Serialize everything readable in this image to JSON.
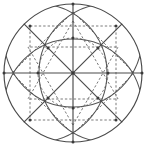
{
  "figure": {
    "background_color": "#ffffff",
    "solid_color": "#4a4a4a",
    "dashed_color": "#7a7a7a",
    "node_color": "#3a3a3a",
    "canvas": {
      "width": 146,
      "height": 147
    },
    "center": {
      "x": 73,
      "y": 73
    },
    "outer_radius": 69,
    "vesica_radius": 69,
    "vesica_offset": 35,
    "inner_radius": 35,
    "labels": {
      "outer_circle": "outer-circle",
      "left_arc": "left-vesica-arc",
      "right_arc": "right-vesica-arc",
      "horizontal_axis": "horizontal-diameter",
      "vertical_axis": "vertical-diameter",
      "diagonal_a": "diagonal-nw-se",
      "diagonal_b": "diagonal-ne-sw",
      "dashed_star": "dashed-star-polygon",
      "inner_dashed_circle": "inner-dashed-circle"
    }
  },
  "chart_data": {
    "type": "diagram",
    "elements": [
      {
        "name": "outer-circle",
        "kind": "circle",
        "cx": 73,
        "cy": 73,
        "r": 69,
        "style": "solid"
      },
      {
        "name": "left-vesica-arc",
        "kind": "circle",
        "cx": 38,
        "cy": 73,
        "r": 69,
        "style": "solid",
        "clipped": true
      },
      {
        "name": "right-vesica-arc",
        "kind": "circle",
        "cx": 108,
        "cy": 73,
        "r": 69,
        "style": "solid",
        "clipped": true
      },
      {
        "name": "horizontal-diameter",
        "kind": "line",
        "x1": 4,
        "y1": 73,
        "x2": 142,
        "y2": 73,
        "style": "solid"
      },
      {
        "name": "vertical-diameter",
        "kind": "line",
        "x1": 73,
        "y1": 4,
        "x2": 73,
        "y2": 142,
        "style": "solid"
      },
      {
        "name": "diagonal-nw-se",
        "kind": "line",
        "x1": 24,
        "y1": 24,
        "x2": 122,
        "y2": 122,
        "style": "solid"
      },
      {
        "name": "diagonal-ne-sw",
        "kind": "line",
        "x1": 122,
        "y1": 24,
        "x2": 24,
        "y2": 122,
        "style": "solid"
      },
      {
        "name": "inner-dashed-circle",
        "kind": "circle",
        "cx": 73,
        "cy": 73,
        "r": 35,
        "style": "dashed"
      },
      {
        "name": "dashed-star-polygon",
        "kind": "star",
        "points": 6,
        "radius": 52,
        "style": "dashed"
      }
    ],
    "nodes": [
      {
        "x": 73,
        "y": 4
      },
      {
        "x": 142,
        "y": 73
      },
      {
        "x": 73,
        "y": 142
      },
      {
        "x": 4,
        "y": 73
      },
      {
        "x": 38,
        "y": 73
      },
      {
        "x": 108,
        "y": 73
      },
      {
        "x": 73,
        "y": 38
      },
      {
        "x": 73,
        "y": 108
      },
      {
        "x": 48,
        "y": 48
      },
      {
        "x": 98,
        "y": 48
      },
      {
        "x": 98,
        "y": 98
      },
      {
        "x": 48,
        "y": 98
      },
      {
        "x": 30,
        "y": 26
      },
      {
        "x": 116,
        "y": 26
      },
      {
        "x": 116,
        "y": 120
      },
      {
        "x": 30,
        "y": 120
      }
    ]
  }
}
